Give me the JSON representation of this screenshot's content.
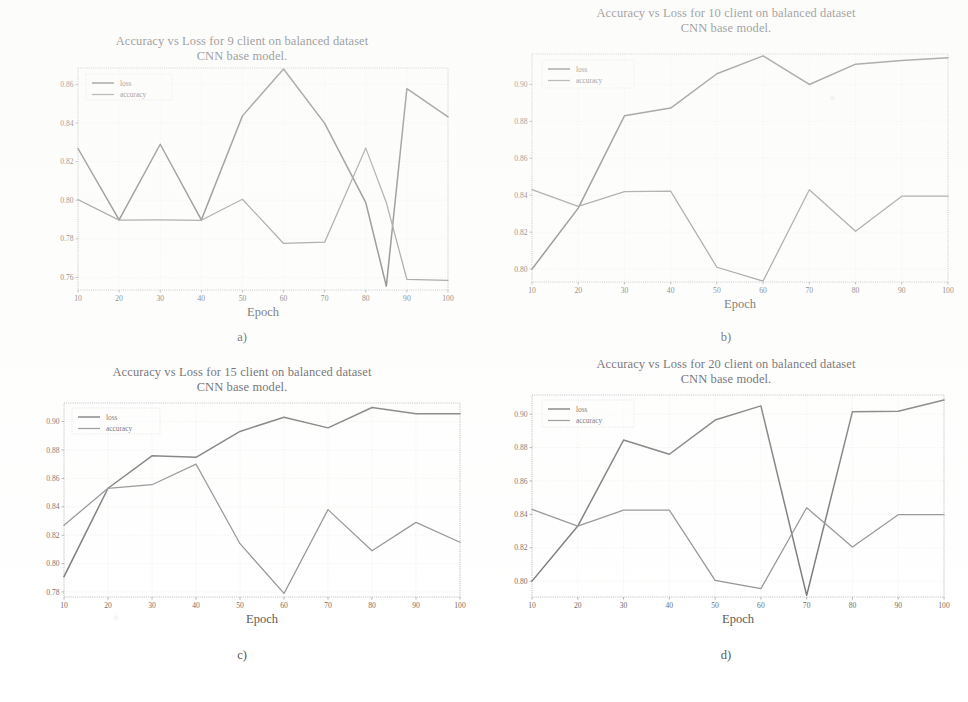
{
  "figure": {
    "caption_a": "a)",
    "caption_b": "b)",
    "caption_c": "c)",
    "caption_d": "d)",
    "legend_loss": "loss",
    "legend_accuracy": "accuracy",
    "xlabel": "Epoch",
    "ylabel": "Value"
  },
  "chart_data": [
    {
      "id": "a",
      "type": "line",
      "title": "Accuracy vs Loss for 9 client on balanced dataset",
      "subtitle": "CNN base model.",
      "panel_label": "a)",
      "xlabel": "Epoch",
      "ylabel": "Value",
      "grid": true,
      "legend_position": "upper-left",
      "x": [
        10,
        20,
        30,
        40,
        50,
        60,
        70,
        80,
        85,
        90,
        100
      ],
      "xticks": [
        10,
        20,
        30,
        40,
        50,
        60,
        70,
        80,
        90,
        100
      ],
      "xlim": [
        10,
        100
      ],
      "yticks": [
        0.76,
        0.78,
        0.8,
        0.82,
        0.84,
        0.86
      ],
      "ylim": [
        0.7535,
        0.8685
      ],
      "series": [
        {
          "name": "loss",
          "values": [
            0.8268,
            0.7898,
            0.829,
            0.7898,
            0.8437,
            0.868,
            0.8398,
            0.7988,
            0.7555,
            0.8578,
            0.8432
          ]
        },
        {
          "name": "accuracy",
          "values": [
            0.8003,
            0.7897,
            0.7898,
            0.7896,
            0.8005,
            0.7776,
            0.7783,
            0.827,
            0.7988,
            0.759,
            0.7585
          ]
        }
      ]
    },
    {
      "id": "b",
      "type": "line",
      "title": "Accuracy vs Loss for 10 client on balanced dataset",
      "subtitle": "CNN base model.",
      "panel_label": "b)",
      "xlabel": "Epoch",
      "ylabel": "Value",
      "grid": true,
      "legend_position": "upper-left",
      "x": [
        10,
        20,
        30,
        40,
        50,
        60,
        70,
        80,
        90,
        100
      ],
      "xticks": [
        10,
        20,
        30,
        40,
        50,
        60,
        70,
        80,
        90,
        100
      ],
      "xlim": [
        10,
        100
      ],
      "yticks": [
        0.8,
        0.82,
        0.84,
        0.86,
        0.88,
        0.9
      ],
      "ylim": [
        0.793,
        0.9165
      ],
      "series": [
        {
          "name": "loss",
          "values": [
            0.8,
            0.833,
            0.883,
            0.8872,
            0.9058,
            0.9155,
            0.9,
            0.911,
            0.913,
            0.9145
          ]
        },
        {
          "name": "accuracy",
          "values": [
            0.843,
            0.834,
            0.842,
            0.8422,
            0.801,
            0.7935,
            0.843,
            0.8205,
            0.8395,
            0.8395
          ]
        }
      ]
    },
    {
      "id": "c",
      "type": "line",
      "title": "Accuracy vs Loss for 15 client on balanced dataset",
      "subtitle": "CNN base model.",
      "panel_label": "c)",
      "xlabel": "Epoch",
      "ylabel": "Value",
      "grid": true,
      "legend_position": "upper-left",
      "x": [
        10,
        20,
        30,
        40,
        50,
        60,
        70,
        80,
        90,
        100
      ],
      "xticks": [
        10,
        20,
        30,
        40,
        50,
        60,
        70,
        80,
        90,
        100
      ],
      "xlim": [
        10,
        100
      ],
      "yticks": [
        0.78,
        0.8,
        0.82,
        0.84,
        0.86,
        0.88,
        0.9
      ],
      "ylim": [
        0.7765,
        0.913
      ],
      "series": [
        {
          "name": "loss",
          "values": [
            0.7908,
            0.853,
            0.8758,
            0.8748,
            0.893,
            0.903,
            0.8955,
            0.9098,
            0.9055,
            0.9055
          ]
        },
        {
          "name": "accuracy",
          "values": [
            0.827,
            0.853,
            0.8555,
            0.87,
            0.814,
            0.779,
            0.838,
            0.809,
            0.829,
            0.815
          ]
        }
      ]
    },
    {
      "id": "d",
      "type": "line",
      "title": "Accuracy vs Loss for 20 client on balanced dataset",
      "subtitle": "CNN base model.",
      "panel_label": "d)",
      "xlabel": "Epoch",
      "ylabel": "Value",
      "grid": true,
      "legend_position": "upper-left",
      "x": [
        10,
        20,
        30,
        40,
        50,
        60,
        70,
        80,
        90,
        100
      ],
      "xticks": [
        10,
        20,
        30,
        40,
        50,
        60,
        70,
        80,
        90,
        100
      ],
      "xlim": [
        10,
        100
      ],
      "yticks": [
        0.8,
        0.82,
        0.84,
        0.86,
        0.88,
        0.9
      ],
      "ylim": [
        0.7905,
        0.9115
      ],
      "series": [
        {
          "name": "loss",
          "values": [
            0.8,
            0.833,
            0.8845,
            0.876,
            0.8965,
            0.905,
            0.7915,
            0.9015,
            0.9018,
            0.9085
          ]
        },
        {
          "name": "accuracy",
          "values": [
            0.843,
            0.833,
            0.8425,
            0.8425,
            0.8005,
            0.7955,
            0.844,
            0.8205,
            0.8398,
            0.8398
          ]
        }
      ]
    }
  ]
}
